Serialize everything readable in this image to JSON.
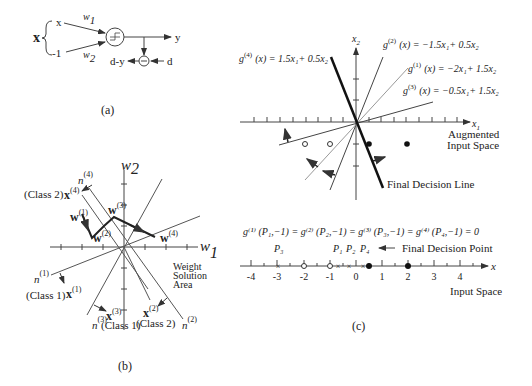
{
  "panel_a": {
    "caption": "(a)",
    "input_vector": "x",
    "inputs": [
      "x",
      "-1"
    ],
    "weights": [
      "w",
      "w"
    ],
    "weight_subs": [
      "1",
      "2"
    ],
    "output": "y",
    "desired": "d",
    "error": "d-y",
    "colors": {
      "line": "#444444"
    }
  },
  "panel_b": {
    "caption": "(b)",
    "axis_x": "w",
    "axis_x_sub": "1",
    "axis_y": "w",
    "axis_y_sub": "2",
    "weight_labels": [
      "w",
      "w",
      "w",
      "w"
    ],
    "weight_sups": [
      "(1)",
      "(2)",
      "(3)",
      "(4)"
    ],
    "normals": [
      {
        "n": "n",
        "sup": "(1)",
        "x": "x",
        "xsup": "(1)",
        "class": "(Class 1)"
      },
      {
        "n": "n",
        "sup": "(2)",
        "x": "x",
        "xsup": "(2)",
        "class": "(Class 2)"
      },
      {
        "n": "n",
        "sup": "(3)",
        "x": "x",
        "xsup": "(3)",
        "class": "(Class 1)"
      },
      {
        "n": "n",
        "sup": "(4)",
        "x": "x",
        "xsup": "(4)",
        "class": "(Class 2)"
      }
    ],
    "region_label": [
      "Weight",
      "Solution",
      "Area"
    ]
  },
  "panel_c": {
    "caption": "(c)",
    "axis_x1": "x",
    "axis_x1_sub": "1",
    "axis_x2": "x",
    "axis_x2_sub": "2",
    "equations": [
      {
        "g": "g",
        "sup": "(4)",
        "rhs": "(x)  =  1.5x₁+ 0.5x₂"
      },
      {
        "g": "g",
        "sup": "(2)",
        "rhs": "(x)  =  −1.5x₁+ 0.5x₂"
      },
      {
        "g": "g",
        "sup": "(1)",
        "rhs": "(x)  =  −2x₁+ 1.5x₂"
      },
      {
        "g": "g",
        "sup": "(3)",
        "rhs": "(x)  =  −0.5x₁+ 1.5x₂"
      }
    ],
    "augmented_label": [
      "Augmented",
      "Input Space"
    ],
    "final_line_label": "Final Decision Line",
    "condition": "g⁽¹⁾ (P₁,−1)  =  g⁽²⁾ (P₂,−1)  =  g⁽³⁾ (P₃,−1) =  g⁽⁴⁾ (P₄,−1)  =  0",
    "number_line": {
      "axis_label": "x",
      "ticks": [
        "-4",
        "-3",
        "-2",
        "-1",
        "0",
        "1",
        "2",
        "3",
        "4"
      ],
      "points": [
        "P₃",
        "P₁",
        "P₂",
        "P₄"
      ],
      "final_point_label": "Final Decision Point",
      "space_label": "Input Space"
    }
  }
}
